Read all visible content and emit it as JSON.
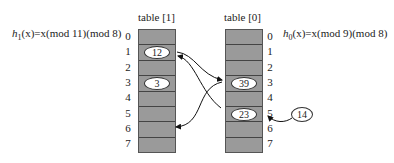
{
  "table1": {
    "title": "table [1]",
    "formula": {
      "h": "h",
      "sub": "1",
      "rest": "(x)=x(mod 11)(mod 8)"
    },
    "indices": [
      "0",
      "1",
      "2",
      "3",
      "4",
      "5",
      "6",
      "7"
    ],
    "cells": [
      "",
      "12",
      "",
      "3",
      "",
      "",
      "",
      ""
    ]
  },
  "table0": {
    "title": "table [0]",
    "formula": {
      "h": "h",
      "sub": "0",
      "rest": "(x)=x(mod 9)(mod 8)"
    },
    "indices": [
      "0",
      "1",
      "2",
      "3",
      "4",
      "5",
      "6",
      "7"
    ],
    "cells": [
      "",
      "",
      "",
      "39",
      "",
      "23",
      "",
      ""
    ]
  },
  "incoming_key": "14",
  "colors": {
    "cell_fill": "#9a9a9a",
    "border": "#444444",
    "arrow": "#111111"
  }
}
